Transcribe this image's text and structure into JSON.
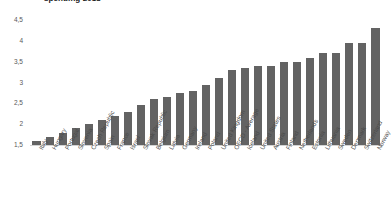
{
  "chart_data": {
    "type": "bar",
    "title": "spending 2018",
    "xlabel": "",
    "ylabel": "",
    "ylim": [
      1.5,
      4.5
    ],
    "ytick_labels": [
      "4,5",
      "4",
      "3,5",
      "3",
      "2,5",
      "2",
      "1,5"
    ],
    "ytick_values": [
      4.5,
      4.0,
      3.5,
      3.0,
      2.5,
      2.0,
      1.5
    ],
    "grid": false,
    "legend": "none",
    "bar_color": "#636363",
    "decimal_separator": ",",
    "categories": [
      "Italy",
      "Hungary",
      "Portugal",
      "Slovenia",
      "Czech Republic",
      "Spain",
      "France",
      "Israel",
      "Slovak Republic",
      "Belgium",
      "Latvia",
      "Germany",
      "Ireland",
      "Poland",
      "United Kingdom",
      "OECD - Average",
      "Iceland",
      "United States",
      "Austria",
      "Finland",
      "Netherlands",
      "Estonia",
      "Lithuania",
      "Sweden",
      "Denmark",
      "Switzerland",
      "Norway"
    ],
    "values": [
      1.6,
      1.7,
      1.8,
      1.9,
      2.0,
      2.1,
      2.2,
      2.3,
      2.45,
      2.6,
      2.65,
      2.75,
      2.8,
      2.95,
      3.1,
      3.3,
      3.35,
      3.4,
      3.4,
      3.5,
      3.5,
      3.6,
      3.7,
      3.7,
      3.95,
      3.95,
      4.3
    ]
  }
}
